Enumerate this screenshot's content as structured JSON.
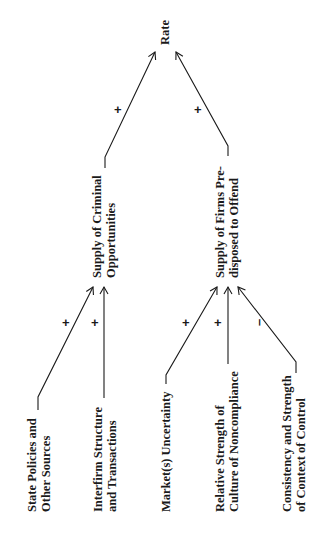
{
  "diagram": {
    "orientation": "rotated-90-ccw",
    "nodes": {
      "rate": {
        "lines": [
          "Rate"
        ]
      },
      "supply_criminal": {
        "lines": [
          "Supply of Criminal",
          "Opportunities"
        ]
      },
      "supply_firms": {
        "lines": [
          "Supply of Firms Pre-",
          "disposed to Offend"
        ]
      },
      "state_policies": {
        "lines": [
          "State Policies and",
          "Other Sources"
        ]
      },
      "interfirm": {
        "lines": [
          "Interfirm Structure",
          "and Transactions"
        ]
      },
      "market": {
        "lines": [
          "Market(s) Uncertainty"
        ]
      },
      "culture": {
        "lines": [
          "Relative Strength of",
          "Culture of Noncompliance"
        ]
      },
      "control": {
        "lines": [
          "Consistency and Strength",
          "of Context of Control"
        ]
      }
    },
    "edges": [
      {
        "from": "supply_criminal",
        "to": "rate",
        "sign": "+"
      },
      {
        "from": "supply_firms",
        "to": "rate",
        "sign": "+"
      },
      {
        "from": "state_policies",
        "to": "supply_criminal",
        "sign": "+"
      },
      {
        "from": "interfirm",
        "to": "supply_criminal",
        "sign": "+"
      },
      {
        "from": "market",
        "to": "supply_firms",
        "sign": "+"
      },
      {
        "from": "culture",
        "to": "supply_firms",
        "sign": "+"
      },
      {
        "from": "control",
        "to": "supply_firms",
        "sign": "–"
      }
    ]
  }
}
